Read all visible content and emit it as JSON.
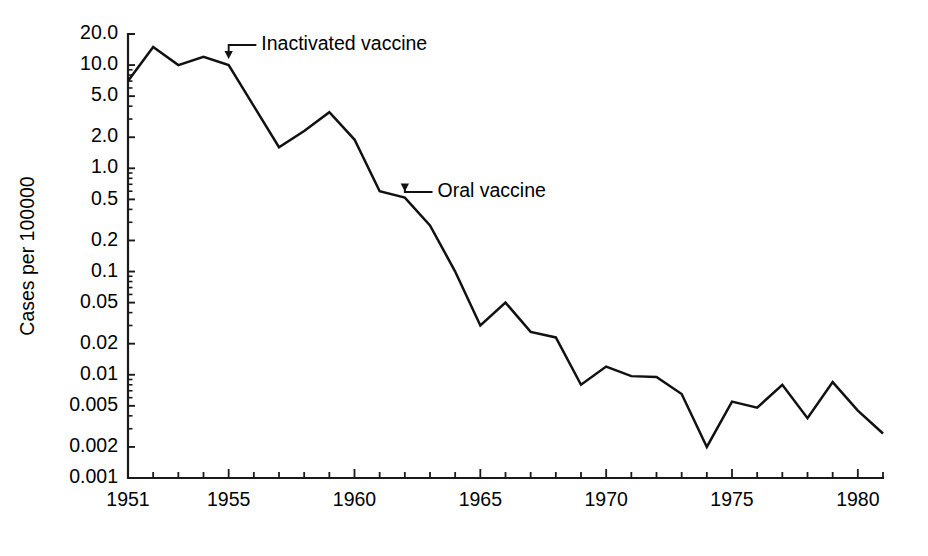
{
  "chart_data": {
    "type": "line",
    "title": "",
    "subtitle": "",
    "xlabel": "",
    "ylabel": "Cases per 100000",
    "yscale": "log",
    "ylim": [
      0.001,
      20.0
    ],
    "xlim": [
      1951,
      1981
    ],
    "grid": false,
    "legend": null,
    "y_tick_labels": [
      "20.0",
      "10.0",
      "5.0",
      "2.0",
      "1.0",
      "0.5",
      "0.2",
      "0.1",
      "0.05",
      "0.02",
      "0.01",
      "0.005",
      "0.002",
      "0.001"
    ],
    "y_tick_values": [
      20.0,
      10.0,
      5.0,
      2.0,
      1.0,
      0.5,
      0.2,
      0.1,
      0.05,
      0.02,
      0.01,
      0.005,
      0.002,
      0.001
    ],
    "x_tick_labels": [
      "1951",
      "1955",
      "1960",
      "1965",
      "1970",
      "1975",
      "1980"
    ],
    "x_tick_values": [
      1951,
      1955,
      1960,
      1965,
      1970,
      1975,
      1980
    ],
    "x_minor_ticks": [
      1952,
      1953,
      1954,
      1956,
      1957,
      1958,
      1959,
      1961,
      1962,
      1963,
      1964,
      1966,
      1967,
      1968,
      1969,
      1971,
      1972,
      1973,
      1974,
      1976,
      1977,
      1978,
      1979,
      1981
    ],
    "series": [
      {
        "name": "Poliomyelitis cases",
        "color": "#111111",
        "x": [
          1951,
          1952,
          1953,
          1954,
          1955,
          1956,
          1957,
          1958,
          1959,
          1960,
          1961,
          1962,
          1963,
          1964,
          1965,
          1966,
          1967,
          1968,
          1969,
          1970,
          1971,
          1972,
          1973,
          1974,
          1975,
          1976,
          1977,
          1978,
          1979,
          1980,
          1981
        ],
        "values": [
          7.0,
          15.0,
          10.0,
          12.0,
          10.0,
          4.0,
          1.6,
          2.3,
          3.5,
          1.9,
          0.6,
          0.52,
          0.28,
          0.1,
          0.03,
          0.05,
          0.026,
          0.023,
          0.008,
          0.012,
          0.0097,
          0.0095,
          0.0065,
          0.002,
          0.0055,
          0.0048,
          0.008,
          0.0038,
          0.0085,
          0.0045,
          0.0027
        ]
      }
    ],
    "annotations": [
      {
        "text": "Inactivated vaccine",
        "target_x": 1955,
        "target_y": 10.0,
        "label_x": 1956.1,
        "label_y_px": 45
      },
      {
        "text": "Oral vaccine",
        "target_x": 1962,
        "target_y": 0.52,
        "label_x": 1963.1,
        "label_y_px": 192
      }
    ]
  },
  "figure": {
    "background": "#ffffff",
    "axis_color": "#1a1a1a",
    "line_color": "#111111",
    "plot_left_px": 128,
    "plot_right_px": 883,
    "plot_top_px": 34,
    "plot_bottom_px": 478
  }
}
